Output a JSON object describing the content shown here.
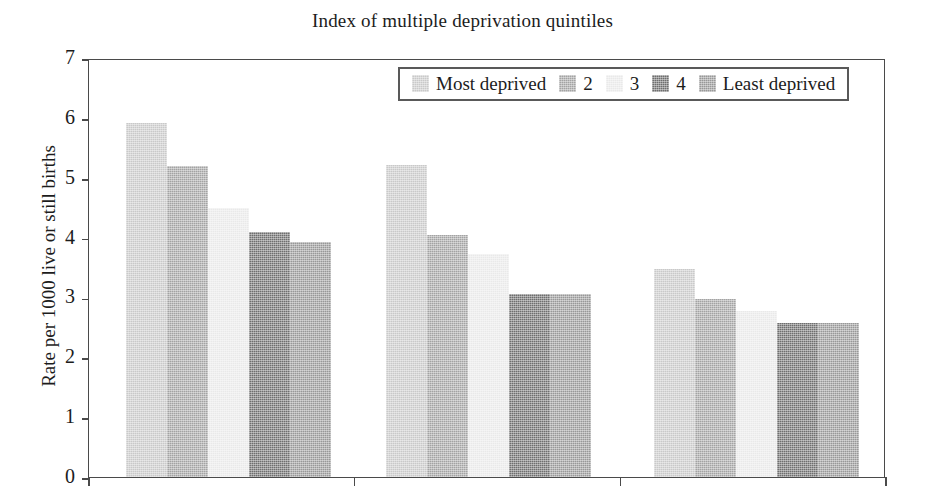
{
  "chart_data": {
    "type": "bar",
    "title": "Index of multiple deprivation quintiles",
    "xlabel": "",
    "ylabel": "Rate per 1000 live or still births",
    "ylim": [
      0,
      7
    ],
    "yticks": [
      "0",
      "1",
      "2",
      "3",
      "4",
      "5",
      "6",
      "7"
    ],
    "ytick_values": [
      0,
      1,
      2,
      3,
      4,
      5,
      6,
      7
    ],
    "grid": false,
    "legend_position": "top-right-inside",
    "categories": [
      "Group 1",
      "Group 2",
      "Group 3"
    ],
    "xtick_labels": [
      "",
      "",
      ""
    ],
    "series": [
      {
        "name": "Most deprived",
        "color": "#c9c9c9",
        "values": [
          5.91,
          5.22,
          3.48
        ]
      },
      {
        "name": "2",
        "color": "#a3a3a3",
        "values": [
          5.2,
          4.05,
          2.98
        ]
      },
      {
        "name": "3",
        "color": "#e9e9e9",
        "values": [
          4.5,
          3.73,
          2.78
        ]
      },
      {
        "name": "4",
        "color": "#6e6e6e",
        "values": [
          4.1,
          3.06,
          2.58
        ]
      },
      {
        "name": "Least deprived",
        "color": "#989898",
        "values": [
          3.92,
          3.06,
          2.58
        ]
      }
    ]
  },
  "axes": {
    "border_color": "#4a4a4a",
    "tick_color": "#4a4a4a",
    "text_color": "#1c1c1c"
  }
}
